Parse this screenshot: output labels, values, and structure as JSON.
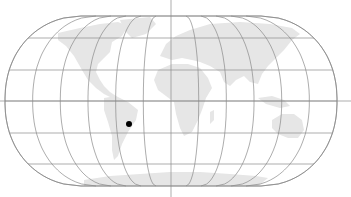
{
  "map": {
    "projection": "robinson",
    "background": "#ffffff",
    "land_color": "#e6e6e6",
    "grid_color": "#8a8a8a",
    "center_x": 171,
    "equator_y": 101,
    "half_width_at_equator": 166,
    "parallels_deg": [
      -90,
      -60,
      -30,
      0,
      30,
      60,
      90
    ],
    "parallels_y": [
      186,
      164,
      133,
      101,
      70,
      38,
      16
    ],
    "pole_half_width": 90,
    "meridian_spacing_deg": 30,
    "axes": {
      "vertical": {
        "x": 171,
        "y1": 0,
        "y2": 197
      },
      "horizontal": {
        "y": 101,
        "x1": 0,
        "x2": 351
      }
    },
    "marker": {
      "name": "location-point",
      "region": "Brazil",
      "x": 129,
      "y": 124,
      "r": 3,
      "color": "#000000"
    }
  }
}
